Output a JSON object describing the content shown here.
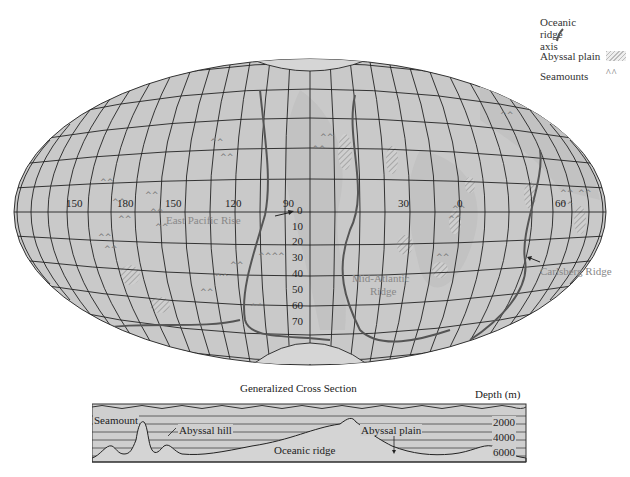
{
  "legend": {
    "ridge_axis": "Oceanic ridge axis",
    "ridge_axis_line1": "Oceanic",
    "ridge_axis_line2": "ridge axis",
    "abyssal_plain": "Abyssal plain",
    "seamounts": "Seamounts",
    "seamount_symbol": "^^"
  },
  "map": {
    "longitude_labels": [
      "150",
      "180",
      "150",
      "120",
      "90",
      "30",
      "0",
      "60"
    ],
    "latitude_labels": [
      "0",
      "10",
      "20",
      "30",
      "40",
      "50",
      "60",
      "70"
    ],
    "features": {
      "east_pacific_rise": "East Pacific Rise",
      "mid_atlantic_ridge_line1": "Mid-Atlantic",
      "mid_atlantic_ridge_line2": "Ridge",
      "carlsberg_ridge": "Carlsberg Ridge"
    },
    "colors": {
      "ocean": "#c9c9c9",
      "grid": "#222222",
      "ridge": "#555555",
      "land": "#bdbdbd"
    }
  },
  "cross_section": {
    "title": "Generalized Cross Section",
    "depth_label": "Depth (m)",
    "depth_ticks": [
      "2000",
      "4000",
      "6000"
    ],
    "labels": {
      "seamount": "Seamount",
      "abyssal_hill": "Abyssal hill",
      "oceanic_ridge": "Oceanic ridge",
      "abyssal_plain": "Abyssal plain"
    }
  }
}
